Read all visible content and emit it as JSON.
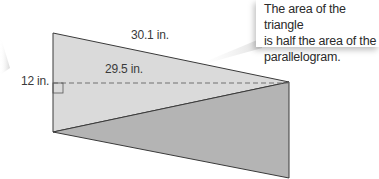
{
  "labels": {
    "slant_side": "30.1 in.",
    "base": "29.5 in.",
    "height": "12 in."
  },
  "callout": {
    "line1": "The area of the triangle",
    "line2": "is half the area of the",
    "line3": "parallelogram."
  },
  "colors": {
    "upper_triangle": "#dadada",
    "lower_triangle": "#b4b4b4",
    "edge": "#3a3a3a",
    "dashed": "#707070"
  }
}
